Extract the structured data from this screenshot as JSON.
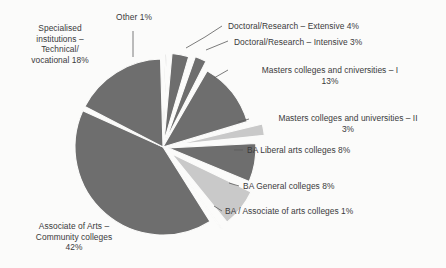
{
  "chart_data": {
    "type": "pie",
    "title": "",
    "subtitle": "",
    "xlabel": "",
    "ylabel": "",
    "legend_position": "none",
    "grid": false,
    "units": "percent",
    "total": 101,
    "start_angle_deg": 0,
    "direction": "clockwise",
    "categories": [
      "Other",
      "Doctoral/Research – Extensive",
      "Doctoral/Research – Intensive",
      "Masters colleges and cniversities – I",
      "Masters colleges and universities – II",
      "BA Liberal arts colleges",
      "BA General colleges",
      "BA / Associate of arts colleges",
      "Associate of Arts – Community colleges",
      "Specialised institutions – Technical/ vocational"
    ],
    "values": [
      1,
      4,
      3,
      13,
      3,
      8,
      8,
      1,
      42,
      18
    ],
    "slices": [
      {
        "name": "other",
        "label": "Other 1%",
        "value": 1,
        "color": "#6e6e6e",
        "tone": "dark",
        "exploded": true,
        "explode_px": 5
      },
      {
        "name": "doctoral-extensive",
        "label": "Doctoral/Research – Extensive 4%",
        "value": 4,
        "color": "#6e6e6e",
        "tone": "dark",
        "exploded": true,
        "explode_px": 6
      },
      {
        "name": "doctoral-intensive",
        "label": "Doctoral/Research – Intensive 3%",
        "value": 3,
        "color": "#6e6e6e",
        "tone": "dark",
        "exploded": true,
        "explode_px": 8
      },
      {
        "name": "masters-i",
        "label": "Masters colleges and cniversities – I\n13%",
        "value": 13,
        "color": "#6e6e6e",
        "tone": "dark",
        "exploded": false,
        "explode_px": 0
      },
      {
        "name": "masters-ii",
        "label": "Masters colleges and universities – II\n3%",
        "value": 3,
        "color": "#c9c9c9",
        "tone": "light",
        "exploded": true,
        "explode_px": 14
      },
      {
        "name": "ba-liberal-arts",
        "label": "BA Liberal arts colleges 8%",
        "value": 8,
        "color": "#6e6e6e",
        "tone": "dark",
        "exploded": true,
        "explode_px": 5
      },
      {
        "name": "ba-general",
        "label": "BA General colleges 8%",
        "value": 8,
        "color": "#c9c9c9",
        "tone": "light",
        "exploded": true,
        "explode_px": 11
      },
      {
        "name": "ba-associate",
        "label": "BA / Associate of arts colleges 1%",
        "value": 1,
        "color": "#c9c9c9",
        "tone": "light",
        "exploded": true,
        "explode_px": 13
      },
      {
        "name": "associate-of-arts",
        "label": "Associate of Arts –\nCommunity colleges\n42%",
        "value": 42,
        "color": "#6e6e6e",
        "tone": "dark",
        "exploded": false,
        "explode_px": 0
      },
      {
        "name": "specialised-institutions",
        "label": "Specialised\ninstitutions –\nTechnical/\nvocational 18%",
        "value": 18,
        "color": "#6e6e6e",
        "tone": "dark",
        "exploded": false,
        "explode_px": 0
      }
    ],
    "colors": {
      "dark_slice": "#6e6e6e",
      "light_slice": "#c9c9c9",
      "separator": "#fbfbfa",
      "leader_line": "#5a5a5a",
      "text": "#3a3a3a",
      "background": "#fbfbfa"
    }
  },
  "labels": {
    "specialised": "Specialised\ninstitutions –\nTechnical/\nvocational 18%",
    "other": "Other 1%",
    "doctoral_extensive": "Doctoral/Research – Extensive 4%",
    "doctoral_intensive": "Doctoral/Research – Intensive 3%",
    "masters_i": "Masters colleges and cniversities – I\n13%",
    "masters_ii": "Masters colleges and universities – II\n3%",
    "ba_liberal": "BA Liberal arts colleges 8%",
    "ba_general": "BA General colleges 8%",
    "ba_associate": "BA / Associate of arts colleges 1%",
    "associate_arts": "Associate of Arts –\nCommunity colleges\n42%"
  }
}
